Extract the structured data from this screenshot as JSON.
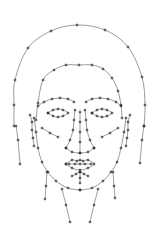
{
  "diagram": {
    "type": "facial-landmark-mesh",
    "background": "#ffffff",
    "stroke_color": "#555555",
    "point_color": "#222222",
    "parts": [
      {
        "name": "head-outline",
        "points": [
          [
            14,
            126
          ],
          [
            14,
            105
          ],
          [
            15,
            80
          ],
          [
            28,
            48
          ],
          [
            51,
            31
          ],
          [
            77,
            25
          ],
          [
            105,
            30
          ],
          [
            128,
            47
          ],
          [
            142,
            77
          ],
          [
            145,
            105
          ],
          [
            144,
            126
          ]
        ]
      },
      {
        "name": "hairline",
        "points": [
          [
            36,
            120
          ],
          [
            38,
            103
          ],
          [
            43,
            80
          ],
          [
            54,
            70
          ],
          [
            66,
            65
          ],
          [
            79,
            65
          ],
          [
            92,
            65
          ],
          [
            103,
            69
          ],
          [
            112,
            78
          ],
          [
            118,
            91
          ],
          [
            121,
            105
          ],
          [
            122,
            118
          ]
        ]
      },
      {
        "name": "jaw-left",
        "points": [
          [
            34,
            118
          ],
          [
            36,
            132
          ],
          [
            38,
            148
          ],
          [
            42,
            162
          ],
          [
            48,
            172
          ],
          [
            56,
            181
          ],
          [
            68,
            188
          ],
          [
            80,
            190
          ]
        ]
      },
      {
        "name": "jaw-right",
        "points": [
          [
            126,
            118
          ],
          [
            124,
            132
          ],
          [
            121,
            148
          ],
          [
            117,
            162
          ],
          [
            111,
            172
          ],
          [
            103,
            181
          ],
          [
            92,
            188
          ],
          [
            80,
            190
          ]
        ]
      },
      {
        "name": "left-brow",
        "points": [
          [
            38,
            106
          ],
          [
            44,
            102
          ],
          [
            52,
            99
          ],
          [
            60,
            98
          ],
          [
            68,
            99
          ],
          [
            74,
            102
          ]
        ]
      },
      {
        "name": "right-brow",
        "points": [
          [
            86,
            102
          ],
          [
            92,
            99
          ],
          [
            100,
            98
          ],
          [
            108,
            99
          ],
          [
            116,
            102
          ],
          [
            121,
            106
          ]
        ]
      },
      {
        "name": "left-eye",
        "points": [
          [
            48,
            113
          ],
          [
            53,
            110
          ],
          [
            58,
            109
          ],
          [
            63,
            110
          ],
          [
            68,
            113
          ],
          [
            63,
            116
          ],
          [
            58,
            117
          ],
          [
            53,
            116
          ],
          [
            48,
            113
          ]
        ]
      },
      {
        "name": "right-eye",
        "points": [
          [
            92,
            113
          ],
          [
            97,
            110
          ],
          [
            102,
            109
          ],
          [
            107,
            110
          ],
          [
            112,
            113
          ],
          [
            107,
            116
          ],
          [
            102,
            117
          ],
          [
            97,
            116
          ],
          [
            92,
            113
          ]
        ]
      },
      {
        "name": "nose-bridge-left",
        "points": [
          [
            75,
            110
          ],
          [
            74,
            120
          ],
          [
            73,
            130
          ],
          [
            70,
            140
          ],
          [
            66,
            148
          ]
        ]
      },
      {
        "name": "nose-bridge-right",
        "points": [
          [
            85,
            110
          ],
          [
            86,
            120
          ],
          [
            87,
            130
          ],
          [
            90,
            140
          ],
          [
            94,
            148
          ]
        ]
      },
      {
        "name": "nose-base",
        "points": [
          [
            66,
            148
          ],
          [
            72,
            152
          ],
          [
            80,
            153
          ],
          [
            88,
            152
          ],
          [
            94,
            148
          ]
        ]
      },
      {
        "name": "nose-center",
        "points": [
          [
            80,
            112
          ],
          [
            80,
            122
          ],
          [
            80,
            132
          ],
          [
            80,
            142
          ],
          [
            80,
            153
          ]
        ]
      },
      {
        "name": "left-cheek",
        "points": [
          [
            42,
            128
          ],
          [
            50,
            133
          ],
          [
            58,
            137
          ]
        ]
      },
      {
        "name": "right-cheek",
        "points": [
          [
            102,
            137
          ],
          [
            110,
            133
          ],
          [
            118,
            128
          ]
        ]
      },
      {
        "name": "mouth-outer",
        "points": [
          [
            66,
            164
          ],
          [
            72,
            160
          ],
          [
            77,
            161
          ],
          [
            80,
            160
          ],
          [
            83,
            161
          ],
          [
            88,
            160
          ],
          [
            94,
            164
          ],
          [
            88,
            168
          ],
          [
            80,
            170
          ],
          [
            72,
            168
          ],
          [
            66,
            164
          ]
        ]
      },
      {
        "name": "mouth-inner",
        "points": [
          [
            69,
            164
          ],
          [
            75,
            164
          ],
          [
            80,
            164
          ],
          [
            85,
            164
          ],
          [
            91,
            164
          ]
        ]
      },
      {
        "name": "chin",
        "points": [
          [
            72,
            176
          ],
          [
            76,
            174
          ],
          [
            80,
            172
          ],
          [
            84,
            174
          ],
          [
            88,
            176
          ]
        ]
      },
      {
        "name": "chin-center",
        "points": [
          [
            80,
            172
          ],
          [
            80,
            178
          ],
          [
            80,
            183
          ]
        ]
      },
      {
        "name": "left-ear",
        "points": [
          [
            30,
            115
          ],
          [
            32,
            122
          ],
          [
            32,
            130
          ],
          [
            33,
            138
          ],
          [
            34,
            146
          ]
        ]
      },
      {
        "name": "right-ear",
        "points": [
          [
            130,
            115
          ],
          [
            128,
            122
          ],
          [
            128,
            130
          ],
          [
            127,
            138
          ],
          [
            126,
            146
          ]
        ]
      },
      {
        "name": "neck-left-outer",
        "points": [
          [
            16,
            126
          ],
          [
            18,
            140
          ],
          [
            20,
            164
          ]
        ]
      },
      {
        "name": "neck-right-outer",
        "points": [
          [
            144,
            126
          ],
          [
            142,
            140
          ],
          [
            140,
            163
          ]
        ]
      },
      {
        "name": "neck-left-mid",
        "points": [
          [
            47,
            172
          ],
          [
            46,
            186
          ],
          [
            45,
            199
          ]
        ]
      },
      {
        "name": "neck-right-mid",
        "points": [
          [
            113,
            172
          ],
          [
            114,
            186
          ],
          [
            115,
            198
          ]
        ]
      },
      {
        "name": "neck-left-inner",
        "points": [
          [
            62,
            189
          ],
          [
            66,
            205
          ],
          [
            70,
            222
          ]
        ]
      },
      {
        "name": "neck-right-inner",
        "points": [
          [
            98,
            189
          ],
          [
            94,
            205
          ],
          [
            90,
            222
          ]
        ]
      }
    ]
  }
}
